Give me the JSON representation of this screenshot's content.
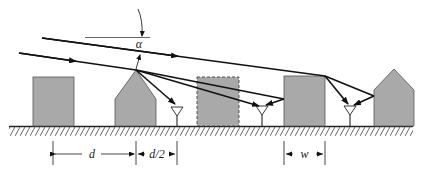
{
  "diagram": {
    "type": "propagation-geometry",
    "labels": {
      "angle": "α",
      "spacing": "d",
      "half_spacing": "d/2",
      "width": "w"
    },
    "colors": {
      "building_fill": "#a9a9a9",
      "building_stroke": "#555555",
      "ray": "#111111",
      "ground": "#222222",
      "background": "#ffffff"
    },
    "buildings": [
      {
        "id": "building-1",
        "shape": "flat-roof",
        "style": "solid"
      },
      {
        "id": "building-2",
        "shape": "gabled-roof",
        "style": "solid"
      },
      {
        "id": "building-3",
        "shape": "flat-roof",
        "style": "dashed"
      },
      {
        "id": "building-4",
        "shape": "flat-roof",
        "style": "solid"
      },
      {
        "id": "building-5",
        "shape": "gabled-roof",
        "style": "solid"
      }
    ],
    "antennas": [
      {
        "id": "antenna-1"
      },
      {
        "id": "antenna-2"
      },
      {
        "id": "antenna-3"
      }
    ],
    "rays": [
      {
        "id": "incident-ray-upper"
      },
      {
        "id": "incident-ray-lower"
      }
    ]
  }
}
